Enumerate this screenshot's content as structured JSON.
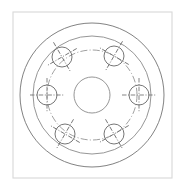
{
  "document": {
    "title": "Bolt Circle Flange Detail",
    "drawing_type": "engineering-drawing",
    "background_color": "#ffffff"
  },
  "frame": {
    "name": "drawing-border",
    "x": 13,
    "y": 12,
    "width": 159,
    "height": 166,
    "stroke_color": "#d8d8d8",
    "fill_color": "#ffffff"
  },
  "geometry": {
    "center": {
      "x": 92,
      "y": 95
    },
    "circles": [
      {
        "name": "outer-diameter-circle",
        "radius": 72,
        "style": "solid",
        "stroke_color": "#7b7b7b"
      },
      {
        "name": "rim-diameter-circle",
        "radius": 59,
        "style": "solid",
        "stroke_color": "#8a8a8a"
      },
      {
        "name": "bolt-circle",
        "radius": 45,
        "style": "dash-dot",
        "stroke_color": "#8f8f8f"
      },
      {
        "name": "center-bore-circle",
        "radius": 18,
        "style": "solid",
        "stroke_color": "#8a8a8a"
      }
    ],
    "bolt_holes": {
      "count": 6,
      "hole_radius": 10,
      "centerline_overhang": 7,
      "stroke_color": "#6f6f6f",
      "items": [
        {
          "name": "bolt-hole-1",
          "cx": 139,
          "cy": 95,
          "angle_deg": 0,
          "crosshair_rotation_deg": 0
        },
        {
          "name": "bolt-hole-2",
          "cx": 114,
          "cy": 134,
          "angle_deg": 60,
          "crosshair_rotation_deg": 60
        },
        {
          "name": "bolt-hole-3",
          "cx": 65,
          "cy": 134,
          "angle_deg": 120,
          "crosshair_rotation_deg": 120
        },
        {
          "name": "bolt-hole-4",
          "cx": 47,
          "cy": 95,
          "angle_deg": 180,
          "crosshair_rotation_deg": 0
        },
        {
          "name": "bolt-hole-5",
          "cx": 62,
          "cy": 57,
          "angle_deg": 240,
          "crosshair_rotation_deg": 60
        },
        {
          "name": "bolt-hole-6",
          "cx": 114,
          "cy": 56,
          "angle_deg": 300,
          "crosshair_rotation_deg": 120
        }
      ]
    }
  }
}
